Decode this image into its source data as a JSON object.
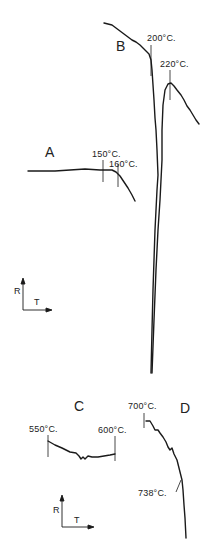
{
  "figure": {
    "curves": {
      "A": {
        "label": "A",
        "annotations": [
          "150°C.",
          "160°C."
        ]
      },
      "B": {
        "label": "B",
        "annotations": [
          "200°C.",
          "220°C."
        ]
      },
      "C": {
        "label": "C",
        "annotations": [
          "550°C.",
          "600°C."
        ]
      },
      "D": {
        "label": "D",
        "annotations": [
          "700°C.",
          "738°C."
        ]
      }
    },
    "axes_upper": {
      "y": "R",
      "x": "T"
    },
    "axes_lower": {
      "y": "R",
      "x": "T"
    },
    "line_color": "#1a1a1a"
  }
}
